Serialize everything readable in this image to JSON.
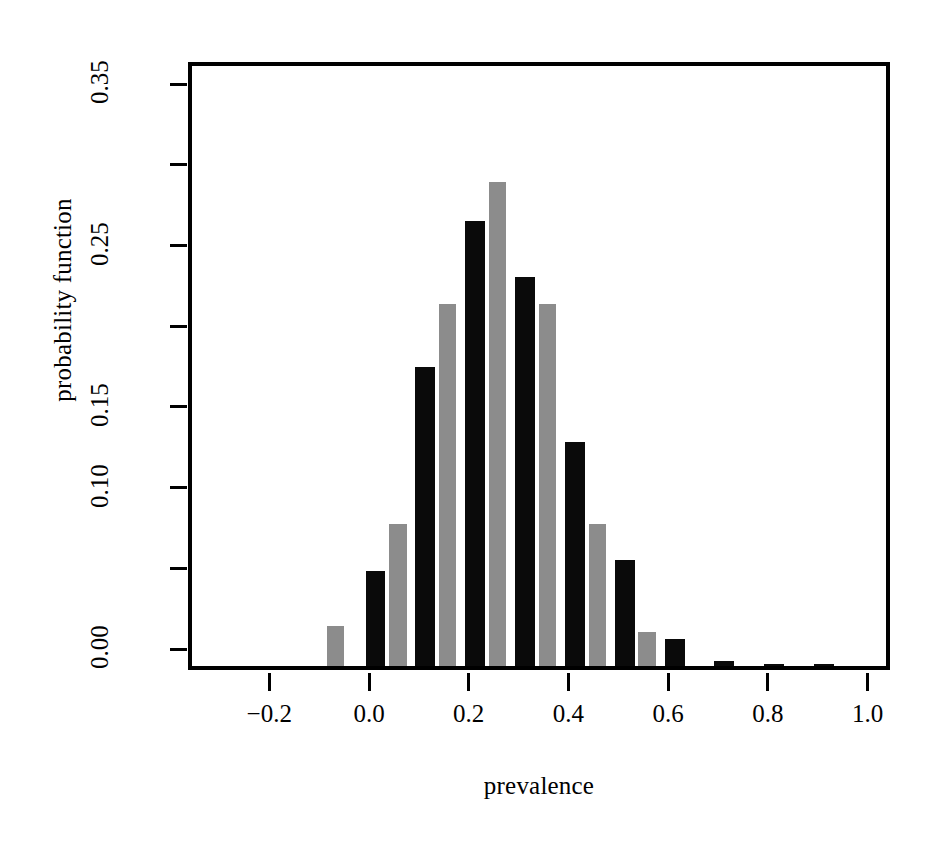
{
  "chart_data": {
    "type": "bar",
    "title": "",
    "xlabel": "prevalence",
    "ylabel": "probability function",
    "xlim": [
      -0.34,
      1.1
    ],
    "ylim": [
      0.0,
      0.362
    ],
    "grid": false,
    "legend": "none",
    "xticks": [
      -0.2,
      0.0,
      0.2,
      0.4,
      0.6,
      0.8,
      1.0
    ],
    "xticklabels": [
      "-0.2",
      "0.0",
      "0.2",
      "0.4",
      "0.6",
      "0.8",
      "1.0"
    ],
    "yticks": [
      0.0,
      0.05,
      0.1,
      0.15,
      0.2,
      0.25,
      0.3,
      0.35
    ],
    "yticklabels": [
      "0.00",
      "",
      "0.10",
      "0.15",
      "",
      "0.25",
      "",
      "0.35"
    ],
    "ytick_labeled": [
      {
        "value": 0.35,
        "label": "0.35"
      },
      {
        "value": 0.25,
        "label": "0.25"
      },
      {
        "value": 0.15,
        "label": "0.15"
      },
      {
        "value": 0.1,
        "label": "0.10"
      },
      {
        "value": 0.0,
        "label": "0.00"
      }
    ],
    "series": [
      {
        "name": "black",
        "color": "#0a0a0a",
        "bar_width": 0.04,
        "points": [
          {
            "x": 0.005,
            "y": 0.072
          },
          {
            "x": 0.105,
            "y": 0.198
          },
          {
            "x": 0.205,
            "y": 0.289
          },
          {
            "x": 0.305,
            "y": 0.254
          },
          {
            "x": 0.405,
            "y": 0.152
          },
          {
            "x": 0.505,
            "y": 0.079
          },
          {
            "x": 0.605,
            "y": 0.03
          },
          {
            "x": 0.705,
            "y": 0.016
          },
          {
            "x": 0.805,
            "y": 0.014
          },
          {
            "x": 0.905,
            "y": 0.014
          }
        ]
      },
      {
        "name": "gray",
        "color": "#8c8c8c",
        "bar_width": 0.035,
        "points": [
          {
            "x": -0.275,
            "y": 0.008
          },
          {
            "x": -0.175,
            "y": 0.01
          },
          {
            "x": -0.075,
            "y": 0.038
          },
          {
            "x": 0.05,
            "y": 0.101
          },
          {
            "x": 0.15,
            "y": 0.237
          },
          {
            "x": 0.25,
            "y": 0.313
          },
          {
            "x": 0.35,
            "y": 0.237
          },
          {
            "x": 0.45,
            "y": 0.101
          },
          {
            "x": 0.55,
            "y": 0.034
          },
          {
            "x": 0.65,
            "y": 0.013
          },
          {
            "x": 0.75,
            "y": 0.01
          },
          {
            "x": 0.85,
            "y": 0.01
          }
        ]
      }
    ]
  }
}
